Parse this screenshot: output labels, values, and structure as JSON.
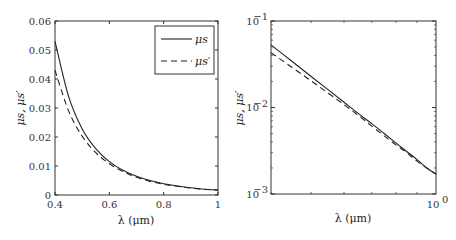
{
  "chart_data": [
    {
      "type": "line",
      "title": "",
      "xlabel": "λ (μm)",
      "ylabel": "μs, μs′",
      "xscale": "linear",
      "yscale": "linear",
      "xlim": [
        0.4,
        1
      ],
      "ylim": [
        0,
        0.06
      ],
      "xticks": [
        "0.4",
        "0.6",
        "0.8",
        "1"
      ],
      "yticks": [
        "0",
        "0.01",
        "0.02",
        "0.03",
        "0.04",
        "0.05",
        "0.06"
      ],
      "grid": false,
      "legend_position": "upper right",
      "x": [
        0.4,
        0.45,
        0.5,
        0.55,
        0.6,
        0.65,
        0.7,
        0.75,
        0.8,
        0.85,
        0.9,
        0.95,
        1.0
      ],
      "series": [
        {
          "name": "μs",
          "style": "solid",
          "values": [
            0.053,
            0.034,
            0.0228,
            0.016,
            0.0115,
            0.0085,
            0.0065,
            0.005,
            0.0039,
            0.0031,
            0.0025,
            0.002,
            0.0017
          ]
        },
        {
          "name": "μs′",
          "style": "dashed",
          "values": [
            0.043,
            0.029,
            0.0203,
            0.0146,
            0.0108,
            0.0081,
            0.0061,
            0.0047,
            0.0037,
            0.003,
            0.0024,
            0.002,
            0.0017
          ]
        }
      ]
    },
    {
      "type": "line",
      "title": "",
      "xlabel": "λ (μm)",
      "ylabel": "μs, μs′",
      "xscale": "log",
      "yscale": "log",
      "xlim": [
        0.4,
        1
      ],
      "ylim": [
        0.001,
        0.1
      ],
      "xticks": [
        "10^0"
      ],
      "yticks": [
        "10^-3",
        "10^-2",
        "10^-1"
      ],
      "grid": false,
      "x": [
        0.4,
        0.45,
        0.5,
        0.55,
        0.6,
        0.65,
        0.7,
        0.75,
        0.8,
        0.85,
        0.9,
        0.95,
        1.0
      ],
      "series": [
        {
          "name": "μs",
          "style": "solid",
          "values": [
            0.053,
            0.034,
            0.0228,
            0.016,
            0.0115,
            0.0085,
            0.0065,
            0.005,
            0.0039,
            0.0031,
            0.0025,
            0.002,
            0.0017
          ]
        },
        {
          "name": "μs′",
          "style": "dashed",
          "values": [
            0.043,
            0.029,
            0.0203,
            0.0146,
            0.0108,
            0.0081,
            0.0061,
            0.0047,
            0.0037,
            0.003,
            0.0024,
            0.002,
            0.0017
          ]
        }
      ]
    }
  ],
  "legend": {
    "items": [
      {
        "label": "μs",
        "style": "solid"
      },
      {
        "label": "μs′",
        "style": "dashed"
      }
    ]
  },
  "labels": {
    "left_xlabel": "λ (μm)",
    "right_xlabel": "λ (μm)",
    "ylabel": "μs, μs′"
  },
  "colors": {
    "line": "#222222",
    "axis": "#333333",
    "background": "#ffffff"
  }
}
